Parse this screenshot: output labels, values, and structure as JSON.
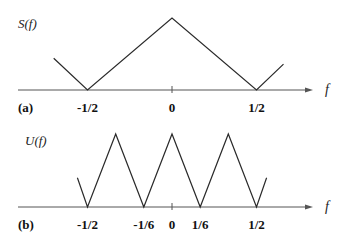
{
  "panels": [
    {
      "id": "a",
      "panel_label": "(a)",
      "function_label": "S(f)",
      "axis_label": "f",
      "ticks": [
        {
          "value": -0.5,
          "label": "-1/2"
        },
        {
          "value": 0,
          "label": "0"
        },
        {
          "value": 0.5,
          "label": "1/2"
        }
      ],
      "curve": {
        "description": "periodic triangular spectrum, period 1, peak at 0, zeros at ±1/2",
        "points": [
          [
            -0.7,
            0.44
          ],
          [
            -0.5,
            0
          ],
          [
            0,
            1
          ],
          [
            0.5,
            0
          ],
          [
            0.66,
            0.36
          ]
        ]
      }
    },
    {
      "id": "b",
      "panel_label": "(b)",
      "function_label": "U(f)",
      "axis_label": "f",
      "ticks": [
        {
          "value": -0.5,
          "label": "-1/2"
        },
        {
          "value": -0.1667,
          "label": "-1/6"
        },
        {
          "value": 0,
          "label": "0"
        },
        {
          "value": 0.1667,
          "label": "1/6"
        },
        {
          "value": 0.5,
          "label": "1/2"
        }
      ],
      "curve": {
        "description": "compressed triangular spectrum, period 1/3, peaks at -1/3, 0, 1/3, zeros at ±1/6 and ±1/2",
        "points": [
          [
            -0.56,
            0.4
          ],
          [
            -0.5,
            0
          ],
          [
            -0.3333,
            1
          ],
          [
            -0.1667,
            0
          ],
          [
            0,
            1
          ],
          [
            0.1667,
            0
          ],
          [
            0.3333,
            1
          ],
          [
            0.5,
            0
          ],
          [
            0.56,
            0.4
          ]
        ]
      }
    }
  ]
}
